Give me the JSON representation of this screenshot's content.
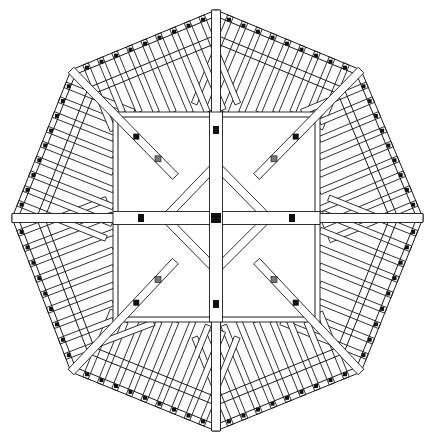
{
  "diagram": {
    "title": "",
    "type": "octagonal roof framing plan",
    "colors": {
      "line": "#1a1a1a",
      "background": "#ffffff",
      "fill_block": "#111111"
    },
    "octagon": [
      [
        216,
        10
      ],
      [
        361,
        70
      ],
      [
        423,
        218
      ],
      [
        361,
        372
      ],
      [
        216,
        431
      ],
      [
        71,
        372
      ],
      [
        12,
        218
      ],
      [
        71,
        70
      ]
    ],
    "inner_square": {
      "x1": 113,
      "y1": 112,
      "x2": 320,
      "y2": 322
    },
    "diamond": [
      [
        216,
        165
      ],
      [
        268,
        218
      ],
      [
        216,
        270
      ],
      [
        165,
        218
      ]
    ],
    "center": [
      216,
      218
    ],
    "rafters_per_side": 9
  }
}
